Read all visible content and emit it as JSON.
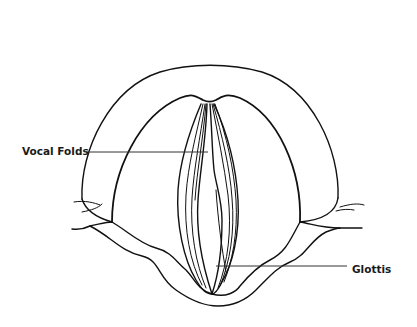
{
  "diagram": {
    "labels": [
      {
        "id": "vocal-folds",
        "text": "Vocal Folds"
      },
      {
        "id": "glottis",
        "text": "Glottis"
      }
    ],
    "colors": {
      "background": "#ffffff",
      "line": "#111111",
      "label_text": "#1a1a1a"
    }
  }
}
